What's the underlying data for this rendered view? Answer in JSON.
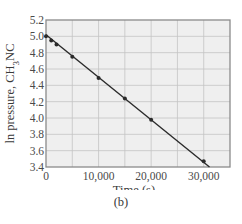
{
  "chart_data": {
    "type": "line",
    "title": "",
    "xlabel": "Time (s)",
    "ylabel": "ln pressure, CH3NC",
    "ylabel_parts": {
      "pre": "ln pressure, CH",
      "sub": "3",
      "post": "NC"
    },
    "xlim": [
      0,
      35000
    ],
    "ylim": [
      3.4,
      5.2
    ],
    "x_ticks": [
      0,
      10000,
      20000,
      30000
    ],
    "x_tick_labels": [
      "0",
      "10,000",
      "20,000",
      "30,000"
    ],
    "x_grid_step": 5000,
    "y_ticks": [
      3.4,
      3.6,
      3.8,
      4.0,
      4.2,
      4.4,
      4.6,
      4.8,
      5.0,
      5.2
    ],
    "y_tick_labels": [
      "3.4",
      "3.6",
      "3.8",
      "4.0",
      "4.2",
      "4.4",
      "4.6",
      "4.8",
      "5.0",
      "5.2"
    ],
    "grid": true,
    "legend": null,
    "series": [
      {
        "name": "ln P(CH3NC)",
        "points": [
          {
            "x": 0,
            "y": 5.0
          },
          {
            "x": 1000,
            "y": 4.95
          },
          {
            "x": 2000,
            "y": 4.9
          },
          {
            "x": 5000,
            "y": 4.75
          },
          {
            "x": 10000,
            "y": 4.49
          },
          {
            "x": 15000,
            "y": 4.24
          },
          {
            "x": 20000,
            "y": 3.98
          },
          {
            "x": 30000,
            "y": 3.47
          }
        ],
        "fit_line": {
          "x0": 0,
          "y0": 5.02,
          "x1": 31100,
          "y1": 3.4
        },
        "color": "#2b2b2b"
      }
    ],
    "caption": "(b)"
  },
  "colors": {
    "plot_background": "#efefef",
    "grid": "#c4c4c4",
    "frame": "#8a8a8a",
    "line": "#2b2b2b"
  }
}
